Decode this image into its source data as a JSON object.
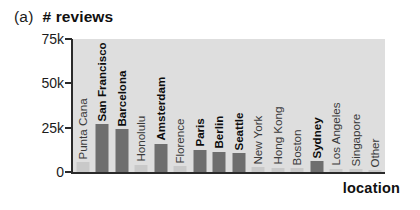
{
  "figure": {
    "panel_tag": "(a)",
    "title": "# reviews",
    "xlabel": "location"
  },
  "chart_data": {
    "type": "bar",
    "title": "# reviews",
    "panel": "(a)",
    "xlabel": "location",
    "ylabel": "",
    "ylim": [
      0,
      75000
    ],
    "yticks": [
      0,
      25000,
      50000,
      75000
    ],
    "ytick_labels": [
      "0",
      "25k",
      "50k",
      "75k"
    ],
    "grid": false,
    "legend": "none",
    "plot_background": "#dedede",
    "highlight_color": "#6e6e6e",
    "normal_color": "#c9c9c9",
    "categories": [
      "Punta Cana",
      "San Francisco",
      "Barcelona",
      "Honolulu",
      "Amsterdam",
      "Florence",
      "Paris",
      "Berlin",
      "Seattle",
      "New York",
      "Hong Kong",
      "Boston",
      "Sydney",
      "Los Angeles",
      "Singapore",
      "Other"
    ],
    "values": [
      5500,
      27000,
      24000,
      4200,
      16000,
      3200,
      12500,
      11500,
      10500,
      2600,
      2300,
      2000,
      6000,
      1800,
      1600,
      900
    ],
    "highlighted": [
      false,
      true,
      true,
      false,
      true,
      false,
      true,
      true,
      true,
      false,
      false,
      false,
      true,
      false,
      false,
      false
    ],
    "label_rotation": 90
  }
}
